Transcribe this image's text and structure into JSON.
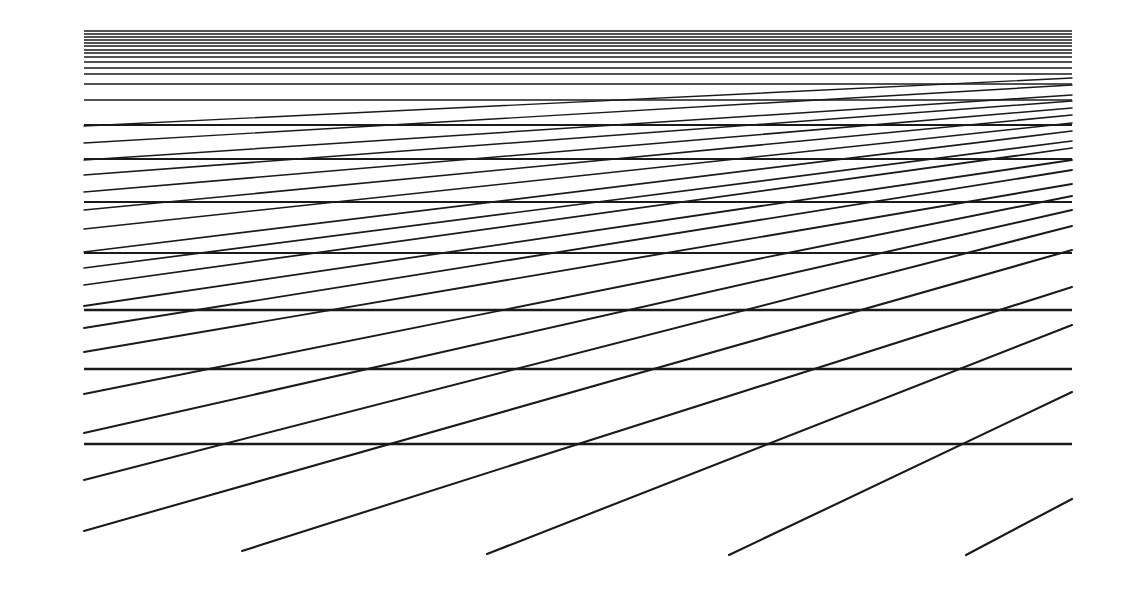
{
  "figure": {
    "stroke_color": "#1a1a1a",
    "background": "#ffffff",
    "bounds": {
      "x_left": 84,
      "x_right": 1072
    },
    "horizontal_lines": [
      {
        "y": 31,
        "w": 1.6
      },
      {
        "y": 34,
        "w": 1.6
      },
      {
        "y": 37,
        "w": 1.6
      },
      {
        "y": 40,
        "w": 1.6
      },
      {
        "y": 43,
        "w": 1.6
      },
      {
        "y": 46,
        "w": 1.6
      },
      {
        "y": 50,
        "w": 1.6
      },
      {
        "y": 53,
        "w": 1.6
      },
      {
        "y": 57,
        "w": 1.6
      },
      {
        "y": 62,
        "w": 1.6
      },
      {
        "y": 68,
        "w": 1.6
      },
      {
        "y": 74,
        "w": 1.6
      },
      {
        "y": 84,
        "w": 1.7
      },
      {
        "y": 100,
        "w": 1.7
      },
      {
        "y": 125,
        "w": 1.8
      },
      {
        "y": 159,
        "w": 2.0
      },
      {
        "y": 202,
        "w": 2.1
      },
      {
        "y": 253,
        "w": 2.2
      },
      {
        "y": 310,
        "w": 2.3
      },
      {
        "y": 369,
        "w": 2.3
      },
      {
        "y": 444,
        "w": 2.4
      }
    ],
    "diagonal_lines": [
      {
        "x1": 84,
        "y1": 126,
        "x2": 1072,
        "y2": 78
      },
      {
        "x1": 84,
        "y1": 143,
        "x2": 1072,
        "y2": 85
      },
      {
        "x1": 84,
        "y1": 160,
        "x2": 1072,
        "y2": 95
      },
      {
        "x1": 84,
        "y1": 175,
        "x2": 1072,
        "y2": 101
      },
      {
        "x1": 84,
        "y1": 192,
        "x2": 1072,
        "y2": 108
      },
      {
        "x1": 84,
        "y1": 210,
        "x2": 1072,
        "y2": 115
      },
      {
        "x1": 84,
        "y1": 229,
        "x2": 1072,
        "y2": 123
      },
      {
        "x1": 84,
        "y1": 252,
        "x2": 1072,
        "y2": 131
      },
      {
        "x1": 84,
        "y1": 268,
        "x2": 1072,
        "y2": 141
      },
      {
        "x1": 84,
        "y1": 285,
        "x2": 1072,
        "y2": 148
      },
      {
        "x1": 84,
        "y1": 306,
        "x2": 1072,
        "y2": 160
      },
      {
        "x1": 84,
        "y1": 328,
        "x2": 1072,
        "y2": 170
      },
      {
        "x1": 84,
        "y1": 352,
        "x2": 1072,
        "y2": 184
      },
      {
        "x1": 84,
        "y1": 394,
        "x2": 1072,
        "y2": 196
      },
      {
        "x1": 84,
        "y1": 433,
        "x2": 1072,
        "y2": 210
      },
      {
        "x1": 84,
        "y1": 480,
        "x2": 1072,
        "y2": 226
      },
      {
        "x1": 84,
        "y1": 531,
        "x2": 1072,
        "y2": 250
      },
      {
        "x1": 242,
        "y1": 551,
        "x2": 1072,
        "y2": 287
      },
      {
        "x1": 487,
        "y1": 554,
        "x2": 1072,
        "y2": 325
      },
      {
        "x1": 729,
        "y1": 555,
        "x2": 1072,
        "y2": 392
      },
      {
        "x1": 966,
        "y1": 555,
        "x2": 1072,
        "y2": 499
      }
    ]
  }
}
